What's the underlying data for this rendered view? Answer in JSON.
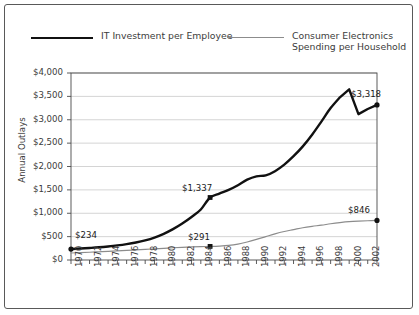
{
  "legend": {
    "items": [
      {
        "label": "IT Investment per Employee",
        "color": "#111111",
        "style": "thick"
      },
      {
        "label": "Consumer Electronics\nSpending per Household",
        "color": "#8c8c8c",
        "style": "thin"
      }
    ]
  },
  "chart_data": {
    "type": "line",
    "title": "",
    "xlabel": "",
    "ylabel": "Annual Outlays",
    "ylim": [
      0,
      4000
    ],
    "ytick_labels": [
      "$0",
      "$500",
      "$1,000",
      "$1,500",
      "$2,000",
      "$2,500",
      "$3,000",
      "$3,500",
      "$4,000"
    ],
    "ytick_values": [
      0,
      500,
      1000,
      1500,
      2000,
      2500,
      3000,
      3500,
      4000
    ],
    "xlim": [
      1970,
      2003
    ],
    "xtick_labels": [
      "1970",
      "1972",
      "1974",
      "1976",
      "1978",
      "1980",
      "1982",
      "1984",
      "1986",
      "1988",
      "1990",
      "1992",
      "1994",
      "1996",
      "1998",
      "2000",
      "2002"
    ],
    "xtick_values": [
      1970,
      1972,
      1974,
      1976,
      1978,
      1980,
      1982,
      1984,
      1986,
      1988,
      1990,
      1992,
      1994,
      1996,
      1998,
      2000,
      2002
    ],
    "grid": "horizontal",
    "legend_position": "top",
    "x": [
      1970,
      1971,
      1972,
      1973,
      1974,
      1975,
      1976,
      1977,
      1978,
      1979,
      1980,
      1981,
      1982,
      1983,
      1984,
      1985,
      1986,
      1987,
      1988,
      1989,
      1990,
      1991,
      1992,
      1993,
      1994,
      1995,
      1996,
      1997,
      1998,
      1999,
      2000,
      2001,
      2002,
      2003
    ],
    "series": [
      {
        "name": "IT Investment per Employee",
        "color": "#111111",
        "width": 2.4,
        "values": [
          234,
          245,
          258,
          272,
          290,
          312,
          340,
          375,
          420,
          480,
          560,
          660,
          780,
          920,
          1080,
          1337,
          1420,
          1500,
          1600,
          1720,
          1790,
          1810,
          1900,
          2040,
          2220,
          2430,
          2680,
          2960,
          3250,
          3480,
          3650,
          3120,
          3230,
          3318
        ],
        "annotations": [
          {
            "x": 1970,
            "y": 234,
            "label": "$234",
            "marker": "circle"
          },
          {
            "x": 1985,
            "y": 1337,
            "label": "$1,337",
            "marker": "square"
          },
          {
            "x": 2003,
            "y": 3318,
            "label": "$3,318",
            "marker": "circle"
          }
        ]
      },
      {
        "name": "Consumer Electronics Spending per Household",
        "color": "#8c8c8c",
        "width": 1.2,
        "values": [
          150,
          158,
          166,
          175,
          184,
          194,
          205,
          215,
          226,
          238,
          250,
          262,
          272,
          281,
          287,
          291,
          298,
          312,
          340,
          385,
          440,
          500,
          560,
          610,
          650,
          690,
          720,
          745,
          775,
          800,
          820,
          832,
          840,
          846
        ],
        "annotations": [
          {
            "x": 1985,
            "y": 291,
            "label": "$291",
            "marker": "square"
          },
          {
            "x": 2003,
            "y": 846,
            "label": "$846",
            "marker": "circle"
          }
        ]
      }
    ]
  }
}
